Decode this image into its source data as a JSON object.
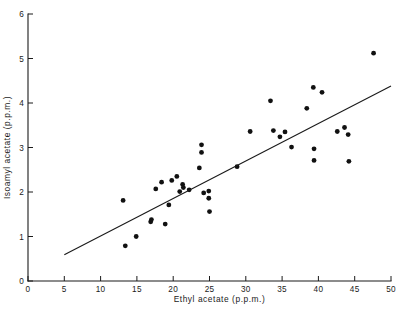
{
  "chart_data": {
    "type": "scatter",
    "title": "",
    "xlabel": "Ethyl acetate (p.p.m.)",
    "ylabel": "Isoamyl acetate (p.p.m.)",
    "xlim": [
      0,
      50
    ],
    "ylim": [
      0,
      6
    ],
    "xticks": [
      0,
      5,
      10,
      15,
      20,
      25,
      30,
      35,
      40,
      45,
      50
    ],
    "xticklabels": [
      "0",
      "5",
      "10",
      "15",
      "20",
      "25",
      "30",
      "35",
      "40",
      "45",
      "50"
    ],
    "yticks": [
      0,
      1,
      2,
      3,
      4,
      5,
      6
    ],
    "yticklabels": [
      "0",
      "1",
      "2",
      "3",
      "4",
      "5",
      "6"
    ],
    "grid": false,
    "legend": null,
    "marker": "filled-circle",
    "marker_color": "#111111",
    "points": [
      {
        "x": 13.1,
        "y": 1.81
      },
      {
        "x": 13.4,
        "y": 0.79
      },
      {
        "x": 14.9,
        "y": 1.0
      },
      {
        "x": 16.9,
        "y": 1.33
      },
      {
        "x": 17.0,
        "y": 1.38
      },
      {
        "x": 17.6,
        "y": 2.07
      },
      {
        "x": 18.4,
        "y": 2.22
      },
      {
        "x": 18.9,
        "y": 1.28
      },
      {
        "x": 19.4,
        "y": 1.71
      },
      {
        "x": 19.8,
        "y": 2.26
      },
      {
        "x": 20.5,
        "y": 2.35
      },
      {
        "x": 20.9,
        "y": 2.01
      },
      {
        "x": 21.3,
        "y": 2.17
      },
      {
        "x": 21.4,
        "y": 2.1
      },
      {
        "x": 22.2,
        "y": 2.05
      },
      {
        "x": 23.6,
        "y": 2.54
      },
      {
        "x": 23.9,
        "y": 3.06
      },
      {
        "x": 23.9,
        "y": 2.89
      },
      {
        "x": 24.2,
        "y": 1.98
      },
      {
        "x": 24.9,
        "y": 2.02
      },
      {
        "x": 24.9,
        "y": 1.86
      },
      {
        "x": 25.0,
        "y": 1.56
      },
      {
        "x": 28.8,
        "y": 2.57
      },
      {
        "x": 30.6,
        "y": 3.36
      },
      {
        "x": 33.4,
        "y": 4.05
      },
      {
        "x": 33.8,
        "y": 3.38
      },
      {
        "x": 34.7,
        "y": 3.24
      },
      {
        "x": 35.4,
        "y": 3.35
      },
      {
        "x": 36.3,
        "y": 3.01
      },
      {
        "x": 38.4,
        "y": 3.88
      },
      {
        "x": 39.3,
        "y": 4.35
      },
      {
        "x": 39.4,
        "y": 2.97
      },
      {
        "x": 39.4,
        "y": 2.71
      },
      {
        "x": 40.5,
        "y": 4.24
      },
      {
        "x": 42.6,
        "y": 3.36
      },
      {
        "x": 43.6,
        "y": 3.45
      },
      {
        "x": 44.1,
        "y": 3.29
      },
      {
        "x": 44.2,
        "y": 2.69
      },
      {
        "x": 47.6,
        "y": 5.12
      }
    ],
    "fit_line": {
      "type": "linear-regression",
      "x_start": 5.0,
      "y_start": 0.59,
      "x_end": 50.0,
      "y_end": 4.38
    }
  }
}
